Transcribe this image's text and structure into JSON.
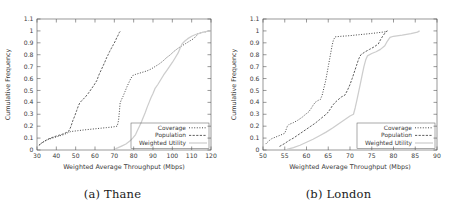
{
  "figure": {
    "panels": [
      {
        "id": "a",
        "caption": "(a) Thane",
        "axis": {
          "xlabel": "Weighted Average Throughput (Mbps)",
          "ylabel": "Cumulative Frequency",
          "xticks": [
            30,
            40,
            50,
            60,
            70,
            80,
            90,
            100,
            110,
            120
          ],
          "xtick_labels": [
            "30",
            "40",
            "50",
            "60",
            "70",
            "80",
            "90",
            "100",
            "110",
            "120"
          ],
          "yticks": [
            0,
            0.1,
            0.2,
            0.3,
            0.4,
            0.5,
            0.6,
            0.7,
            0.8,
            0.9,
            1,
            1.1
          ],
          "ytick_labels": [
            "0",
            "0.1",
            "0.2",
            "0.3",
            "0.4",
            "0.5",
            "0.6",
            "0.7",
            "0.8",
            "0.9",
            "1",
            "1.1"
          ],
          "xlim": [
            30,
            120
          ],
          "ylim": [
            0,
            1.1
          ],
          "grid": false
        },
        "legend": {
          "position": "bottom-right",
          "entries": [
            "Coverage",
            "Population",
            "Weighted Utility"
          ]
        }
      },
      {
        "id": "b",
        "caption": "(b) London",
        "axis": {
          "xlabel": "Weighted Average Throughput (Mbps)",
          "ylabel": "Cumulative Frequency",
          "xticks": [
            50,
            55,
            60,
            65,
            70,
            75,
            80,
            85,
            90
          ],
          "xtick_labels": [
            "50",
            "55",
            "60",
            "65",
            "70",
            "75",
            "80",
            "85",
            "90"
          ],
          "yticks": [
            0,
            0.1,
            0.2,
            0.3,
            0.4,
            0.5,
            0.6,
            0.7,
            0.8,
            0.9,
            1,
            1.1
          ],
          "ytick_labels": [
            "0",
            "0.1",
            "0.2",
            "0.3",
            "0.4",
            "0.5",
            "0.6",
            "0.7",
            "0.8",
            "0.9",
            "1",
            "1.1"
          ],
          "xlim": [
            50,
            90
          ],
          "ylim": [
            0,
            1.1
          ],
          "grid": false
        },
        "legend": {
          "position": "bottom-right",
          "entries": [
            "Coverage",
            "Population",
            "Weighted Utility"
          ]
        }
      }
    ],
    "colors": {
      "coverage": "#3c3c3c",
      "population": "#555555",
      "weighted_utility": "#cdcdcd",
      "axis": "#555555",
      "text": "#3a3a3a"
    }
  },
  "chart_data": [
    {
      "type": "line",
      "title": "(a) Thane",
      "xlabel": "Weighted Average Throughput (Mbps)",
      "ylabel": "Cumulative Frequency",
      "xlim": [
        30,
        120
      ],
      "ylim": [
        0,
        1.1
      ],
      "grid": false,
      "legend_position": "bottom-right",
      "series": [
        {
          "name": "Coverage",
          "style": "dotted",
          "color": "#3c3c3c",
          "points": [
            [
              31.0,
              0.04
            ],
            [
              32.5,
              0.06
            ],
            [
              34.0,
              0.075
            ],
            [
              36.0,
              0.09
            ],
            [
              38.0,
              0.1
            ],
            [
              40.0,
              0.11
            ],
            [
              42.0,
              0.12
            ],
            [
              44.0,
              0.13
            ],
            [
              46.0,
              0.145
            ],
            [
              47.5,
              0.155
            ],
            [
              49.0,
              0.158
            ],
            [
              51.0,
              0.162
            ],
            [
              54.0,
              0.168
            ],
            [
              57.0,
              0.173
            ],
            [
              60.0,
              0.178
            ],
            [
              63.0,
              0.183
            ],
            [
              66.0,
              0.188
            ],
            [
              69.0,
              0.193
            ],
            [
              71.5,
              0.2
            ],
            [
              72.2,
              0.25
            ],
            [
              72.6,
              0.32
            ],
            [
              73.0,
              0.395
            ],
            [
              73.6,
              0.42
            ],
            [
              74.5,
              0.45
            ],
            [
              75.5,
              0.49
            ],
            [
              76.5,
              0.53
            ],
            [
              77.5,
              0.565
            ],
            [
              78.5,
              0.6
            ],
            [
              79.5,
              0.625
            ],
            [
              81.0,
              0.635
            ],
            [
              83.0,
              0.645
            ],
            [
              85.0,
              0.655
            ],
            [
              87.0,
              0.665
            ],
            [
              89.0,
              0.68
            ],
            [
              91.0,
              0.7
            ],
            [
              93.0,
              0.72
            ],
            [
              95.0,
              0.745
            ],
            [
              97.0,
              0.775
            ],
            [
              99.0,
              0.8
            ],
            [
              101.0,
              0.83
            ],
            [
              103.0,
              0.855
            ],
            [
              105.0,
              0.875
            ],
            [
              107.0,
              0.895
            ],
            [
              109.0,
              0.915
            ],
            [
              111.0,
              0.935
            ],
            [
              112.5,
              0.96
            ],
            [
              113.0,
              0.975
            ],
            [
              115.0,
              0.985
            ],
            [
              118.0,
              0.995
            ],
            [
              119.5,
              1.0
            ]
          ]
        },
        {
          "name": "Population",
          "style": "dashed-dotted",
          "color": "#555555",
          "points": [
            [
              31.0,
              0.04
            ],
            [
              33.0,
              0.065
            ],
            [
              35.0,
              0.085
            ],
            [
              37.0,
              0.1
            ],
            [
              39.0,
              0.112
            ],
            [
              41.0,
              0.122
            ],
            [
              43.0,
              0.132
            ],
            [
              45.0,
              0.145
            ],
            [
              46.5,
              0.16
            ],
            [
              47.5,
              0.195
            ],
            [
              48.5,
              0.245
            ],
            [
              49.5,
              0.285
            ],
            [
              50.5,
              0.33
            ],
            [
              51.5,
              0.375
            ],
            [
              52.3,
              0.4
            ],
            [
              53.5,
              0.42
            ],
            [
              55.0,
              0.445
            ],
            [
              56.5,
              0.475
            ],
            [
              58.0,
              0.51
            ],
            [
              59.5,
              0.545
            ],
            [
              61.0,
              0.585
            ],
            [
              62.0,
              0.63
            ],
            [
              63.0,
              0.665
            ],
            [
              64.0,
              0.7
            ],
            [
              65.0,
              0.735
            ],
            [
              66.0,
              0.775
            ],
            [
              66.8,
              0.8
            ],
            [
              67.5,
              0.825
            ],
            [
              68.5,
              0.855
            ],
            [
              69.5,
              0.885
            ],
            [
              70.5,
              0.915
            ],
            [
              71.3,
              0.945
            ],
            [
              72.0,
              0.965
            ],
            [
              72.5,
              0.985
            ],
            [
              73.0,
              0.995
            ]
          ]
        },
        {
          "name": "Weighted Utility",
          "style": "solid",
          "color": "#cdcdcd",
          "points": [
            [
              70.5,
              0.01
            ],
            [
              72.0,
              0.02
            ],
            [
              74.0,
              0.035
            ],
            [
              76.0,
              0.05
            ],
            [
              78.0,
              0.075
            ],
            [
              79.5,
              0.1
            ],
            [
              81.0,
              0.13
            ],
            [
              82.0,
              0.165
            ],
            [
              83.0,
              0.2
            ],
            [
              84.0,
              0.235
            ],
            [
              85.0,
              0.275
            ],
            [
              86.0,
              0.315
            ],
            [
              87.0,
              0.36
            ],
            [
              88.0,
              0.4
            ],
            [
              89.0,
              0.44
            ],
            [
              90.0,
              0.475
            ],
            [
              91.0,
              0.515
            ],
            [
              92.5,
              0.55
            ],
            [
              94.0,
              0.59
            ],
            [
              95.5,
              0.63
            ],
            [
              97.0,
              0.665
            ],
            [
              98.5,
              0.7
            ],
            [
              100.0,
              0.735
            ],
            [
              101.5,
              0.775
            ],
            [
              103.0,
              0.815
            ],
            [
              104.0,
              0.855
            ],
            [
              105.0,
              0.89
            ],
            [
              106.5,
              0.915
            ],
            [
              108.0,
              0.935
            ],
            [
              110.0,
              0.955
            ],
            [
              112.0,
              0.97
            ],
            [
              114.0,
              0.98
            ],
            [
              116.0,
              0.99
            ],
            [
              118.0,
              0.997
            ],
            [
              119.8,
              1.0
            ]
          ]
        }
      ]
    },
    {
      "type": "line",
      "title": "(b) London",
      "xlabel": "Weighted Average Throughput (Mbps)",
      "ylabel": "Cumulative Frequency",
      "xlim": [
        50,
        90
      ],
      "ylim": [
        0,
        1.1
      ],
      "grid": false,
      "legend_position": "bottom-right",
      "series": [
        {
          "name": "Coverage",
          "style": "dotted",
          "color": "#3c3c3c",
          "points": [
            [
              50.6,
              0.05
            ],
            [
              51.3,
              0.075
            ],
            [
              52.0,
              0.095
            ],
            [
              53.0,
              0.11
            ],
            [
              54.0,
              0.125
            ],
            [
              55.0,
              0.14
            ],
            [
              55.3,
              0.17
            ],
            [
              55.6,
              0.2
            ],
            [
              56.0,
              0.215
            ],
            [
              57.0,
              0.23
            ],
            [
              58.0,
              0.25
            ],
            [
              59.0,
              0.275
            ],
            [
              59.8,
              0.3
            ],
            [
              60.5,
              0.32
            ],
            [
              61.0,
              0.345
            ],
            [
              61.5,
              0.375
            ],
            [
              62.0,
              0.4
            ],
            [
              62.6,
              0.415
            ],
            [
              63.2,
              0.425
            ],
            [
              63.6,
              0.46
            ],
            [
              64.0,
              0.52
            ],
            [
              64.4,
              0.58
            ],
            [
              64.7,
              0.64
            ],
            [
              65.0,
              0.7
            ],
            [
              65.3,
              0.76
            ],
            [
              65.6,
              0.82
            ],
            [
              65.9,
              0.88
            ],
            [
              66.2,
              0.925
            ],
            [
              66.6,
              0.95
            ],
            [
              68.0,
              0.955
            ],
            [
              70.0,
              0.96
            ],
            [
              72.0,
              0.968
            ],
            [
              74.0,
              0.975
            ],
            [
              76.0,
              0.983
            ],
            [
              78.0,
              0.992
            ],
            [
              78.6,
              1.0
            ]
          ]
        },
        {
          "name": "Population",
          "style": "dashed-dotted",
          "color": "#555555",
          "points": [
            [
              53.8,
              0.03
            ],
            [
              55.0,
              0.055
            ],
            [
              56.0,
              0.08
            ],
            [
              57.0,
              0.1
            ],
            [
              58.0,
              0.125
            ],
            [
              59.0,
              0.15
            ],
            [
              60.0,
              0.175
            ],
            [
              61.0,
              0.2
            ],
            [
              62.0,
              0.225
            ],
            [
              63.0,
              0.255
            ],
            [
              64.0,
              0.285
            ],
            [
              64.8,
              0.31
            ],
            [
              65.5,
              0.345
            ],
            [
              66.0,
              0.375
            ],
            [
              66.6,
              0.4
            ],
            [
              67.2,
              0.42
            ],
            [
              68.0,
              0.445
            ],
            [
              68.8,
              0.46
            ],
            [
              69.4,
              0.5
            ],
            [
              70.0,
              0.55
            ],
            [
              70.5,
              0.6
            ],
            [
              71.0,
              0.655
            ],
            [
              71.5,
              0.71
            ],
            [
              72.0,
              0.765
            ],
            [
              72.5,
              0.8
            ],
            [
              73.5,
              0.825
            ],
            [
              74.5,
              0.845
            ],
            [
              75.5,
              0.865
            ],
            [
              76.5,
              0.89
            ],
            [
              77.0,
              0.925
            ],
            [
              77.5,
              0.955
            ],
            [
              78.0,
              0.98
            ],
            [
              78.5,
              1.0
            ]
          ]
        },
        {
          "name": "Weighted Utility",
          "style": "solid",
          "color": "#cdcdcd",
          "points": [
            [
              55.5,
              0.005
            ],
            [
              57.0,
              0.02
            ],
            [
              58.5,
              0.04
            ],
            [
              60.0,
              0.065
            ],
            [
              61.5,
              0.09
            ],
            [
              63.0,
              0.12
            ],
            [
              64.5,
              0.15
            ],
            [
              66.0,
              0.185
            ],
            [
              67.0,
              0.21
            ],
            [
              68.0,
              0.235
            ],
            [
              69.0,
              0.26
            ],
            [
              70.0,
              0.285
            ],
            [
              70.8,
              0.3
            ],
            [
              71.2,
              0.355
            ],
            [
              71.6,
              0.42
            ],
            [
              72.0,
              0.49
            ],
            [
              72.4,
              0.56
            ],
            [
              72.8,
              0.63
            ],
            [
              73.2,
              0.7
            ],
            [
              73.6,
              0.755
            ],
            [
              74.0,
              0.79
            ],
            [
              75.0,
              0.81
            ],
            [
              76.0,
              0.825
            ],
            [
              77.0,
              0.845
            ],
            [
              78.0,
              0.875
            ],
            [
              78.6,
              0.915
            ],
            [
              79.2,
              0.945
            ],
            [
              80.0,
              0.955
            ],
            [
              82.0,
              0.965
            ],
            [
              84.0,
              0.978
            ],
            [
              85.5,
              0.99
            ],
            [
              86.0,
              1.0
            ]
          ]
        }
      ]
    }
  ]
}
